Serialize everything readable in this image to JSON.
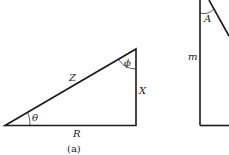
{
  "figure_a": {
    "caption": "(a)",
    "labels": {
      "hypotenuse": "Z",
      "vertical_side": "X",
      "base": "R",
      "angle_bottom_left": "θ",
      "angle_top": "ϕ"
    }
  },
  "figure_b": {
    "labels": {
      "vertical_side": "m",
      "angle_top": "A"
    }
  },
  "colors": {
    "line": "#1a1a1a",
    "background": "#ffffff"
  }
}
